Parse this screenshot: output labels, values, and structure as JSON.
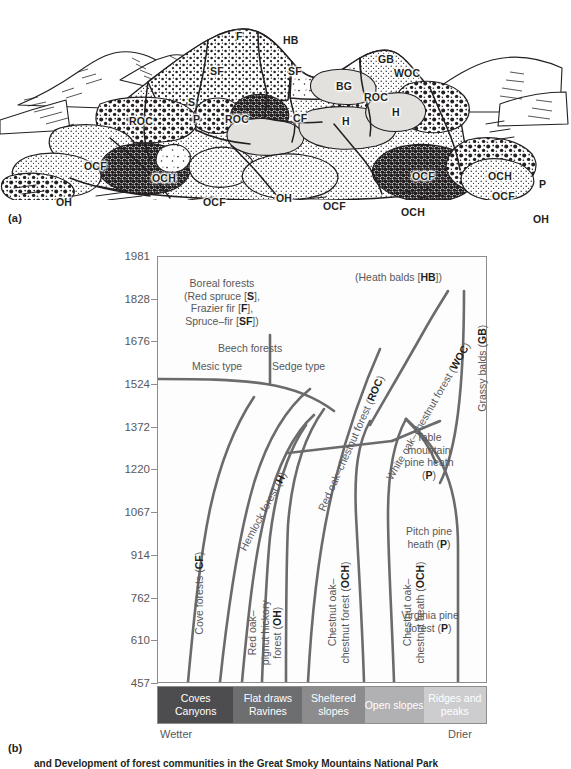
{
  "figure": {
    "panel_a_label": "(a)",
    "panel_b_label": "(b)",
    "caption": "and Development of forest communities in the Great Smoky Mountains National Park"
  },
  "landscape": {
    "description": "Pen-and-ink profile drawing of ridges and coves with vegetation-type abbreviations",
    "labels": [
      {
        "text": "F",
        "x": 236,
        "y": 30
      },
      {
        "text": "HB",
        "x": 283,
        "y": 34
      },
      {
        "text": "SF",
        "x": 210,
        "y": 65
      },
      {
        "text": "SF",
        "x": 288,
        "y": 65
      },
      {
        "text": "GB",
        "x": 378,
        "y": 53
      },
      {
        "text": "WOC",
        "x": 394,
        "y": 67
      },
      {
        "text": "BG",
        "x": 336,
        "y": 80
      },
      {
        "text": "ROC",
        "x": 364,
        "y": 91
      },
      {
        "text": "S",
        "x": 188,
        "y": 96
      },
      {
        "text": "ROC",
        "x": 129,
        "y": 115
      },
      {
        "text": "P",
        "x": 193,
        "y": 113
      },
      {
        "text": "ROC",
        "x": 225,
        "y": 113
      },
      {
        "text": "CF",
        "x": 293,
        "y": 112
      },
      {
        "text": "H",
        "x": 342,
        "y": 115
      },
      {
        "text": "H",
        "x": 392,
        "y": 106
      },
      {
        "text": "OCF",
        "x": 84,
        "y": 160
      },
      {
        "text": "OCH",
        "x": 152,
        "y": 172
      },
      {
        "text": "OH",
        "x": 56,
        "y": 196
      },
      {
        "text": "OCF",
        "x": 203,
        "y": 196
      },
      {
        "text": "OH",
        "x": 276,
        "y": 192
      },
      {
        "text": "OCF",
        "x": 323,
        "y": 200
      },
      {
        "text": "OCF",
        "x": 412,
        "y": 170
      },
      {
        "text": "OCH",
        "x": 401,
        "y": 206
      },
      {
        "text": "OCH",
        "x": 488,
        "y": 170
      },
      {
        "text": "OCF",
        "x": 492,
        "y": 190
      },
      {
        "text": "P",
        "x": 539,
        "y": 178
      },
      {
        "text": "OH",
        "x": 533,
        "y": 213
      }
    ]
  },
  "chart_data": {
    "type": "diagram",
    "title": "",
    "ylabel": "Elevation (meters)",
    "ylim": [
      457,
      1981
    ],
    "yticks": [
      1981,
      1828,
      1676,
      1524,
      1372,
      1220,
      1067,
      914,
      762,
      610,
      457
    ],
    "xlabel_left": "Wetter",
    "xlabel_right": "Drier",
    "grid": false,
    "x_categories": [
      {
        "line1": "Coves",
        "line2": "Canyons",
        "color": "#4d4d4f"
      },
      {
        "line1": "Flat draws",
        "line2": "Ravines",
        "color": "#6d6e70"
      },
      {
        "line1": "Sheltered",
        "line2": "slopes",
        "color": "#8c8c8e"
      },
      {
        "line1": "Open slopes",
        "line2": "",
        "color": "#b1b1b3"
      },
      {
        "line1": "Ridges and",
        "line2": "peaks",
        "color": "#cdcdcf"
      }
    ],
    "regions": [
      {
        "name": "boreal-forests",
        "text": "Boreal forests\n(Red spruce [S],\nFrazier fir [F],\nSpruce–fir [SF])"
      },
      {
        "name": "heath-balds",
        "text": "(Heath balds [HB])"
      },
      {
        "name": "beech-forests",
        "text": "Beech forests"
      },
      {
        "name": "beech-mesic",
        "text": "Mesic type"
      },
      {
        "name": "beech-sedge",
        "text": "Sedge type"
      },
      {
        "name": "cove-forests",
        "text": "Cove forests (CF)"
      },
      {
        "name": "hemlock-forest",
        "text": "Hemlock forest (H)"
      },
      {
        "name": "red-oak-pignut-hickory",
        "text": "Red oak–\npignut hickory\nforest (OH)"
      },
      {
        "name": "chestnut-oak-chestnut-forest",
        "text": "Chestnut oak–\nchestnut forest (OCH)"
      },
      {
        "name": "chestnut-oak-chestnut-heath",
        "text": "Chestnut oak–\nchestnut heath (OCH)"
      },
      {
        "name": "red-oak-chestnut-forest",
        "text": "Red oak–chestnut forest (ROC)"
      },
      {
        "name": "white-oak-chestnut-forest",
        "text": "White oak–chestnut forest (WOC)"
      },
      {
        "name": "grassy-balds",
        "text": "Grassy balds (GB)"
      },
      {
        "name": "table-mountain-pine-heath",
        "text": "Table\nmountain\npine heath\n(P)"
      },
      {
        "name": "pitch-pine-heath",
        "text": "Pitch pine\nheath (P)"
      },
      {
        "name": "virginia-pine-forest",
        "text": "Virginia pine\nforest (P)"
      }
    ]
  },
  "annotations": {
    "boreal_l1": "Boreal forests",
    "boreal_l2": "(Red spruce [",
    "boreal_l2b": "S",
    "boreal_l2c": "],",
    "boreal_l3": "Frazier fir [",
    "boreal_l3b": "F",
    "boreal_l3c": "],",
    "boreal_l4": "Spruce–fir [",
    "boreal_l4b": "SF",
    "boreal_l4c": "])",
    "heath_balds": "(Heath balds [",
    "heath_balds_b": "HB",
    "heath_balds_c": "])",
    "beech_forests": "Beech  forests",
    "mesic_type": "Mesic type",
    "sedge_type": "Sedge type",
    "cove_forests": "Cove forests (",
    "cove_forests_b": "CF",
    "cove_forests_c": ")",
    "hemlock": "Hemlock forest (",
    "hemlock_b": "H",
    "hemlock_c": ")",
    "red_oak_pignut_l1": "Red oak–",
    "red_oak_pignut_l2": "pignut hickory",
    "red_oak_pignut_l3": "forest (",
    "red_oak_pignut_l3b": "OH",
    "red_oak_pignut_l3c": ")",
    "chestnut_forest_l1": "Chestnut oak–",
    "chestnut_forest_l2": "chestnut forest (",
    "chestnut_forest_l2b": "OCH",
    "chestnut_forest_l2c": ")",
    "chestnut_heath_l1": "Chestnut oak–",
    "chestnut_heath_l2": "chestnut heath (",
    "chestnut_heath_l2b": "OCH",
    "chestnut_heath_l2c": ")",
    "red_oak_chestnut": "Red oak–chestnut forest (",
    "red_oak_chestnut_b": "ROC",
    "red_oak_chestnut_c": ")",
    "white_oak_chestnut": "White oak–chestnut forest (",
    "white_oak_chestnut_b": "WOC",
    "white_oak_chestnut_c": ")",
    "grassy_balds": "Grassy balds (",
    "grassy_balds_b": "GB",
    "grassy_balds_c": ")",
    "table_mtn_l1": "Table",
    "table_mtn_l2": "mountain",
    "table_mtn_l3": "pine heath",
    "table_mtn_l4": "(",
    "table_mtn_l4b": "P",
    "table_mtn_l4c": ")",
    "pitch_pine_l1": "Pitch pine",
    "pitch_pine_l2": "heath (",
    "pitch_pine_l2b": "P",
    "pitch_pine_l2c": ")",
    "virginia_pine_l1": "Virginia pine",
    "virginia_pine_l2": "forest (",
    "virginia_pine_l2b": "P",
    "virginia_pine_l2c": ")"
  },
  "colors": {
    "line": "#6b6b6d",
    "frame": "#8d8d8f",
    "text": "#58585a",
    "bold_text": "#231f20"
  }
}
